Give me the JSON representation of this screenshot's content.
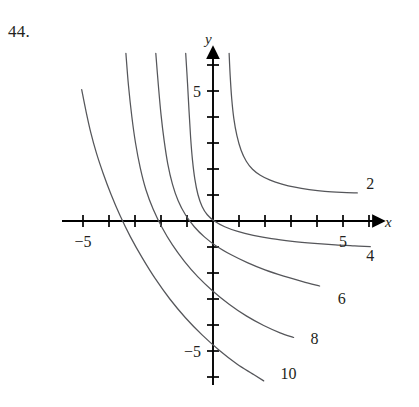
{
  "problem": {
    "number": "44."
  },
  "chart_data": {
    "type": "line",
    "title": "",
    "xlabel": "x",
    "ylabel": "y",
    "xlim": [
      -6.0,
      6.3
    ],
    "ylim": [
      -6.4,
      6.4
    ],
    "grid": false,
    "legend_position": "curve-end-labels",
    "axis_arrows": [
      "x-positive",
      "y-positive"
    ],
    "x_ticks": [
      -6,
      -5,
      -4,
      -3,
      -2,
      -1,
      1,
      2,
      3,
      4,
      5,
      6
    ],
    "y_ticks": [
      -6,
      -5,
      -4,
      -3,
      -2,
      -1,
      1,
      2,
      3,
      4,
      5,
      6
    ],
    "x_tick_labels": [
      {
        "value": -5,
        "text": "−5"
      },
      {
        "value": 5,
        "text": "5"
      }
    ],
    "y_tick_labels": [
      {
        "value": -5,
        "text": "−5"
      },
      {
        "value": 5,
        "text": "5"
      }
    ],
    "series": [
      {
        "name": "2",
        "label": "2",
        "label_x": 6.05,
        "label_y": 1.45,
        "color": "#55565a",
        "points": [
          [
            0.62,
            6.45
          ],
          [
            0.66,
            5.6
          ],
          [
            0.72,
            4.7
          ],
          [
            0.8,
            3.95
          ],
          [
            0.92,
            3.28
          ],
          [
            1.08,
            2.72
          ],
          [
            1.28,
            2.3
          ],
          [
            1.52,
            1.99
          ],
          [
            1.82,
            1.76
          ],
          [
            2.2,
            1.57
          ],
          [
            2.65,
            1.42
          ],
          [
            3.15,
            1.3
          ],
          [
            3.7,
            1.21
          ],
          [
            4.3,
            1.14
          ],
          [
            4.95,
            1.1
          ],
          [
            5.55,
            1.08
          ]
        ]
      },
      {
        "name": "4",
        "label": "4",
        "label_x": 6.05,
        "label_y": -1.3,
        "color": "#55565a",
        "points": [
          [
            -1.05,
            6.45
          ],
          [
            -0.98,
            5.3
          ],
          [
            -0.92,
            4.2
          ],
          [
            -0.86,
            3.2
          ],
          [
            -0.79,
            2.35
          ],
          [
            -0.7,
            1.62
          ],
          [
            -0.58,
            1.02
          ],
          [
            -0.42,
            0.56
          ],
          [
            -0.22,
            0.24
          ],
          [
            0.05,
            0.0
          ],
          [
            0.45,
            -0.22
          ],
          [
            0.95,
            -0.4
          ],
          [
            1.55,
            -0.55
          ],
          [
            2.25,
            -0.68
          ],
          [
            3.05,
            -0.78
          ],
          [
            3.9,
            -0.86
          ],
          [
            4.7,
            -0.92
          ],
          [
            5.45,
            -0.96
          ],
          [
            6.05,
            -0.99
          ]
        ]
      },
      {
        "name": "6",
        "label": "6",
        "label_x": 4.95,
        "label_y": -2.95,
        "color": "#55565a",
        "points": [
          [
            -2.2,
            6.45
          ],
          [
            -2.1,
            5.2
          ],
          [
            -2.0,
            4.1
          ],
          [
            -1.88,
            3.1
          ],
          [
            -1.74,
            2.2
          ],
          [
            -1.56,
            1.42
          ],
          [
            -1.34,
            0.78
          ],
          [
            -1.06,
            0.24
          ],
          [
            -0.72,
            -0.22
          ],
          [
            -0.32,
            -0.62
          ],
          [
            0.15,
            -0.98
          ],
          [
            0.7,
            -1.3
          ],
          [
            1.32,
            -1.6
          ],
          [
            2.0,
            -1.88
          ],
          [
            2.72,
            -2.12
          ],
          [
            3.45,
            -2.33
          ],
          [
            4.1,
            -2.5
          ]
        ]
      },
      {
        "name": "8",
        "label": "8",
        "label_x": 3.9,
        "label_y": -4.5,
        "color": "#55565a",
        "points": [
          [
            -3.35,
            6.45
          ],
          [
            -3.25,
            5.2
          ],
          [
            -3.12,
            4.0
          ],
          [
            -2.98,
            3.0
          ],
          [
            -2.8,
            2.05
          ],
          [
            -2.58,
            1.2
          ],
          [
            -2.3,
            0.45
          ],
          [
            -1.96,
            -0.25
          ],
          [
            -1.56,
            -0.92
          ],
          [
            -1.1,
            -1.55
          ],
          [
            -0.58,
            -2.15
          ],
          [
            0.0,
            -2.7
          ],
          [
            0.62,
            -3.2
          ],
          [
            1.28,
            -3.65
          ],
          [
            1.95,
            -4.02
          ],
          [
            2.58,
            -4.3
          ],
          [
            3.1,
            -4.48
          ]
        ]
      },
      {
        "name": "10",
        "label": "10",
        "label_x": 2.9,
        "label_y": -5.85,
        "color": "#55565a",
        "points": [
          [
            -5.05,
            5.05
          ],
          [
            -4.88,
            4.2
          ],
          [
            -4.7,
            3.4
          ],
          [
            -4.48,
            2.6
          ],
          [
            -4.22,
            1.82
          ],
          [
            -3.92,
            1.02
          ],
          [
            -3.58,
            0.22
          ],
          [
            -3.18,
            -0.6
          ],
          [
            -2.72,
            -1.42
          ],
          [
            -2.22,
            -2.22
          ],
          [
            -1.66,
            -3.0
          ],
          [
            -1.06,
            -3.72
          ],
          [
            -0.42,
            -4.38
          ],
          [
            0.25,
            -4.98
          ],
          [
            0.92,
            -5.5
          ],
          [
            1.52,
            -5.88
          ],
          [
            1.95,
            -6.15
          ]
        ]
      }
    ]
  }
}
